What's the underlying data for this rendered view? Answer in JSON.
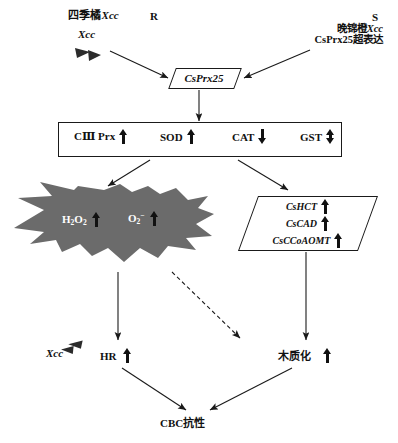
{
  "diagram": {
    "title_hidden": "",
    "colors": {
      "burst_fill": "#6b6b6b",
      "line": "#1a1a1a",
      "text": "#111111",
      "burst_text": "#ffffff"
    },
    "top_left": {
      "cultivar_label": "四季橘",
      "pathogen_italic": "Xcc",
      "resistance_tag": "R",
      "inoculum_label": "Xcc",
      "bacteria_icon": "bacteria-dart-icon"
    },
    "top_right": {
      "cultivar_line": "晚锦橙",
      "pathogen_italic": "Xcc",
      "susceptible_tag": "S",
      "treatment_line": "CsPrx25超表达"
    },
    "central_gene": {
      "label": "CsPrx25"
    },
    "enzyme_box": {
      "items": [
        {
          "label": "CⅢ Prx",
          "trend": "up"
        },
        {
          "label": "SOD",
          "trend": "up"
        },
        {
          "label": "CAT",
          "trend": "down"
        },
        {
          "label": "GST",
          "trend": "updown"
        }
      ]
    },
    "ros_burst": {
      "items": [
        {
          "formula": "H",
          "sub1": "2",
          "mid": "O",
          "sub2": "2",
          "trend": "up"
        },
        {
          "formula": "O",
          "sub1": "2",
          "sup": "−",
          "trend": "up"
        }
      ]
    },
    "lignin_genes": {
      "items": [
        {
          "label": "CsHCT",
          "trend": "up"
        },
        {
          "label": "CsCAD",
          "trend": "up"
        },
        {
          "label": "CsCCoAOMT",
          "trend": "up"
        }
      ]
    },
    "outcomes": {
      "hr_pathogen": "Xcc",
      "hr_label": "HR",
      "hr_trend": "up",
      "lignification_label": "木质化",
      "lignification_trend": "up",
      "conclusion": "CBC抗性"
    }
  }
}
